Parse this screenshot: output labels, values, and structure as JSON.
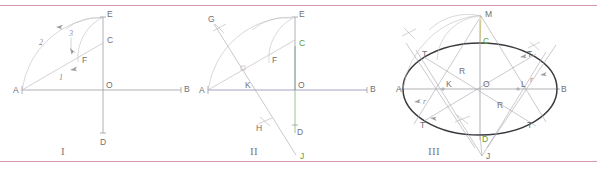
{
  "figure": {
    "background_color": "#ffffff",
    "rule_color": "#d79aa8",
    "axis_color": "#8f8f96",
    "construction_color": "#b9b2b8",
    "ellipse_color": "#3a3a3f",
    "green_color": "#5aa03c",
    "panels": [
      {
        "id": "panel-1",
        "numeral": "I",
        "points": [
          {
            "label": "A",
            "x": 22,
            "y": 90
          },
          {
            "label": "B",
            "x": 182,
            "y": 90
          },
          {
            "label": "O",
            "x": 103,
            "y": 90
          },
          {
            "label": "C",
            "x": 103,
            "y": 43
          },
          {
            "label": "D",
            "x": 103,
            "y": 134
          },
          {
            "label": "E",
            "x": 103,
            "y": 17
          },
          {
            "label": "F",
            "x": 78,
            "y": 62
          }
        ],
        "step_labels": [
          {
            "text": "1",
            "x": 59,
            "y": 78
          },
          {
            "text": "2",
            "x": 41,
            "y": 41
          },
          {
            "text": "3",
            "x": 72,
            "y": 36
          }
        ]
      },
      {
        "id": "panel-2",
        "numeral": "II",
        "points": [
          {
            "label": "A",
            "x": 208,
            "y": 90
          },
          {
            "label": "B",
            "x": 368,
            "y": 90
          },
          {
            "label": "O",
            "x": 295,
            "y": 90
          },
          {
            "label": "C",
            "x": 295,
            "y": 46
          },
          {
            "label": "D",
            "x": 295,
            "y": 133
          },
          {
            "label": "E",
            "x": 295,
            "y": 17
          },
          {
            "label": "F",
            "x": 269,
            "y": 63
          },
          {
            "label": "G",
            "x": 216,
            "y": 22
          },
          {
            "label": "H",
            "x": 262,
            "y": 127
          },
          {
            "label": "J",
            "x": 296,
            "y": 158
          },
          {
            "label": "K",
            "x": 246,
            "y": 88
          }
        ],
        "step_labels": []
      },
      {
        "id": "panel-3",
        "numeral": "III",
        "points": [
          {
            "label": "A",
            "x": 403,
            "y": 89
          },
          {
            "label": "B",
            "x": 557,
            "y": 89
          },
          {
            "label": "O",
            "x": 480,
            "y": 89
          },
          {
            "label": "C",
            "x": 480,
            "y": 43
          },
          {
            "label": "D",
            "x": 480,
            "y": 135
          },
          {
            "label": "M",
            "x": 483,
            "y": 16
          },
          {
            "label": "J",
            "x": 483,
            "y": 158
          },
          {
            "label": "K",
            "x": 443,
            "y": 88
          },
          {
            "label": "L",
            "x": 518,
            "y": 88
          }
        ],
        "tangent_labels": [
          {
            "text": "T",
            "x": 425,
            "y": 54
          },
          {
            "text": "T",
            "x": 528,
            "y": 54
          },
          {
            "text": "T",
            "x": 423,
            "y": 124
          },
          {
            "text": "T",
            "x": 528,
            "y": 124
          }
        ],
        "radius_labels": [
          {
            "text": "r",
            "x": 425,
            "y": 103
          },
          {
            "text": "r",
            "x": 532,
            "y": 80
          },
          {
            "text": "R",
            "x": 462,
            "y": 72
          },
          {
            "text": "R",
            "x": 500,
            "y": 105
          }
        ],
        "ellipse": {
          "cx": 480,
          "cy": 89,
          "rx": 77,
          "ry": 46
        }
      }
    ]
  }
}
